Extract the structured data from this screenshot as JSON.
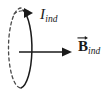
{
  "figure": {
    "background_color": "#ffffff",
    "ink_color": "#1a1a1a",
    "labels": {
      "current": {
        "symbol": "I",
        "subscript": "ind",
        "style": "italic",
        "meaning": "induced current"
      },
      "field": {
        "symbol": "B",
        "subscript": "ind",
        "style": "bold-italic-vector",
        "has_vector_arrow": true,
        "meaning": "induced magnetic field"
      }
    },
    "loop": {
      "shape": "ellipse",
      "center_x": 21,
      "center_y": 48,
      "radius_x": 12.5,
      "radius_y": 40,
      "front_half_style": "solid",
      "back_half_style": "dashed",
      "dash_pattern": "3,3",
      "stroke_width": 1.4,
      "current_arrowhead": {
        "position": "top",
        "direction": "clockwise-from-front",
        "x": 30,
        "y": 13
      }
    },
    "field_arrow": {
      "from_x": 19,
      "from_y": 52,
      "to_x": 72,
      "to_y": 52,
      "direction": "right",
      "stroke_width": 1.6
    }
  }
}
